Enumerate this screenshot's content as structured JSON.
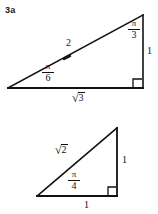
{
  "figure": {
    "problem_label": "3a",
    "background_color": "#ffffff",
    "stroke_color": "#111111",
    "triangles": [
      {
        "name": "30-60-90-triangle",
        "vertices": {
          "left": [
            8,
            88
          ],
          "top_right": [
            143,
            15
          ],
          "bottom_right": [
            143,
            88
          ]
        },
        "right_angle_at": "bottom_right",
        "labels": {
          "hypotenuse": "2",
          "top_angle_numerator": "π",
          "top_angle_denominator": "3",
          "left_angle_numerator": "π",
          "left_angle_denominator": "6",
          "vertical_side": "1",
          "base_radical_sign": "√",
          "base_radicand": "3"
        }
      },
      {
        "name": "45-45-90-triangle",
        "vertices": {
          "left": [
            37,
            196
          ],
          "top_right": [
            117,
            128
          ],
          "bottom_right": [
            117,
            196
          ]
        },
        "right_angle_at": "bottom_right",
        "labels": {
          "hypotenuse_radical_sign": "√",
          "hypotenuse_radicand": "2",
          "left_angle_numerator": "π",
          "left_angle_denominator": "4",
          "vertical_side": "1",
          "base": "1"
        }
      }
    ]
  }
}
